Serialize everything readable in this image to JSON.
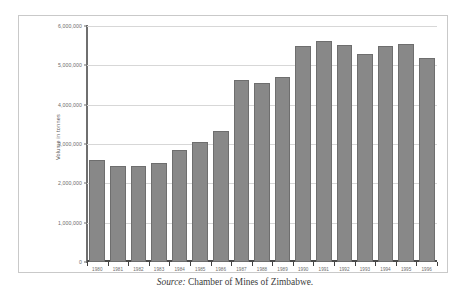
{
  "figure": {
    "caption_source_label": "Source:",
    "caption_text": "Chamber of Mines of Zimbabwe."
  },
  "chart_data": {
    "type": "bar",
    "title": "",
    "xlabel": "",
    "ylabel": "Volume in tonnes",
    "ylim": [
      0,
      6000000
    ],
    "ytick_labels": [
      "0",
      "1,000,000",
      "2,000,000",
      "3,000,000",
      "4,000,000",
      "5,000,000",
      "6,000,000"
    ],
    "ytick_values": [
      0,
      1000000,
      2000000,
      3000000,
      4000000,
      5000000,
      6000000
    ],
    "grid": true,
    "legend": "none",
    "bar_color": "#888888",
    "bar_edge_color": "#6e6e6e",
    "gridline_color": "#d7d7d7",
    "axis_color": "#6f6f6f",
    "categories": [
      "1980",
      "1981",
      "1982",
      "1983",
      "1984",
      "1985",
      "1986",
      "1987",
      "1988",
      "1989",
      "1990",
      "1991",
      "1992",
      "1993",
      "1994",
      "1995",
      "1996"
    ],
    "values": [
      2600000,
      2430000,
      2430000,
      2520000,
      2850000,
      3050000,
      3320000,
      4640000,
      4560000,
      4700000,
      5500000,
      5620000,
      5520000,
      5280000,
      5500000,
      5550000,
      5180000
    ]
  }
}
